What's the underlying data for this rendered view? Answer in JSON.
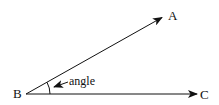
{
  "diagram": {
    "type": "angle-illustration",
    "points": {
      "vertex": {
        "label": "B",
        "x": 26,
        "y": 94
      },
      "ray_end_upper": {
        "label": "A",
        "x": 163,
        "y": 17
      },
      "ray_end_lower": {
        "label": "C",
        "x": 197,
        "y": 94
      }
    },
    "angle_annotation": {
      "label": "angle"
    },
    "colors": {
      "stroke": "#111111",
      "background": "#ffffff"
    }
  }
}
